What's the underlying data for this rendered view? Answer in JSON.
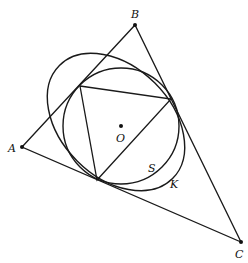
{
  "figure": {
    "width": 248,
    "height": 263,
    "stroke_color": "#1a1a1a",
    "points": {
      "A": {
        "x": 22,
        "y": 147,
        "label": "A",
        "lx": 8,
        "ly": 152
      },
      "B": {
        "x": 135,
        "y": 25,
        "label": "B",
        "lx": 131,
        "ly": 18
      },
      "C": {
        "x": 241,
        "y": 242,
        "label": "C",
        "lx": 235,
        "ly": 258
      },
      "O": {
        "x": 121,
        "y": 126,
        "label": "O",
        "lx": 116,
        "ly": 142
      }
    },
    "outer_triangle": [
      "A",
      "B",
      "C"
    ],
    "inner_triangle": [
      {
        "x": 80,
        "y": 86
      },
      {
        "x": 171,
        "y": 99
      },
      {
        "x": 97,
        "y": 180
      }
    ],
    "circle_S": {
      "cx": 121,
      "cy": 126,
      "r": 58,
      "label": "S",
      "lx": 148,
      "ly": 172
    },
    "ellipse_K": {
      "cx": 116,
      "cy": 122,
      "rx": 80,
      "ry": 55,
      "rotate": 45,
      "label": "K",
      "lx": 170,
      "ly": 188
    }
  }
}
